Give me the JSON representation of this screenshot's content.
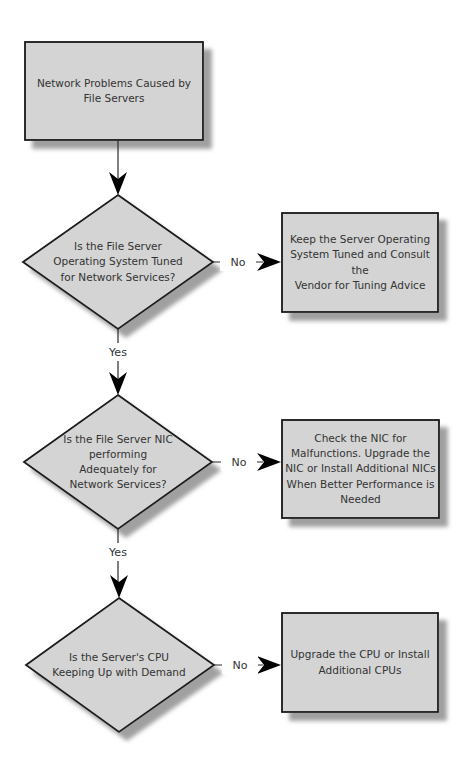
{
  "nodes": {
    "start": {
      "type": "process",
      "label": "Network Problems Caused by\nFile Servers"
    },
    "decision1": {
      "type": "decision",
      "label": "Is the File Server\nOperating System Tuned\nfor Network Services?"
    },
    "action1": {
      "type": "process",
      "label": "Keep the Server Operating\nSystem Tuned and Consult the\nVendor for Tuning Advice"
    },
    "decision2": {
      "type": "decision",
      "label": "Is the File Server NIC\nperforming\nAdequately for\nNetwork Services?"
    },
    "action2": {
      "type": "process",
      "label": "Check the NIC for\nMalfunctions. Upgrade the\nNIC or Install Additional NICs\nWhen Better Performance is\nNeeded"
    },
    "decision3": {
      "type": "decision",
      "label": "Is the Server's CPU\nKeeping Up with Demand"
    },
    "action3": {
      "type": "process",
      "label": "Upgrade the CPU or Install\nAdditional CPUs"
    }
  },
  "edges": {
    "start_to_decision1": {
      "from": "start",
      "to": "decision1",
      "label": ""
    },
    "decision1_no": {
      "from": "decision1",
      "to": "action1",
      "label": "No"
    },
    "decision1_yes": {
      "from": "decision1",
      "to": "decision2",
      "label": "Yes"
    },
    "decision2_no": {
      "from": "decision2",
      "to": "action2",
      "label": "No"
    },
    "decision2_yes": {
      "from": "decision2",
      "to": "decision3",
      "label": "Yes"
    },
    "decision3_no": {
      "from": "decision3",
      "to": "action3",
      "label": "No"
    }
  },
  "colors": {
    "node_fill": "#d4d4d4",
    "node_border": "#1a1a1a",
    "shadow": "#8f8f8f",
    "connector": "#2b2b2b",
    "arrowhead": "#000000",
    "text": "#333333",
    "background": "#ffffff"
  }
}
